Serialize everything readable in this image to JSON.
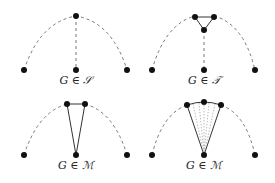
{
  "panels": [
    {
      "label": "G ∈ 𝒮",
      "name": "star"
    },
    {
      "label": "G ∈ 𝒯",
      "name": "triangle"
    },
    {
      "label": "G ∈ ℳ",
      "name": "m-two"
    },
    {
      "label": "G ∈ ℳ",
      "name": "m-multi"
    }
  ],
  "colors": {
    "node": "#111111",
    "dashed": "#777777",
    "solid": "#333333",
    "dotted": "#999999"
  }
}
